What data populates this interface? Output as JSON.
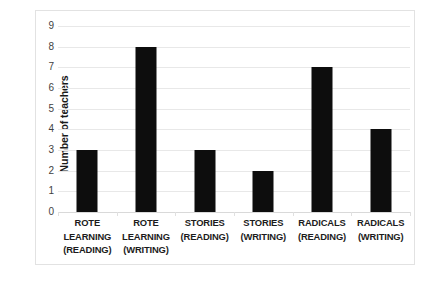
{
  "chart_data": {
    "type": "bar",
    "title": "",
    "xlabel": "",
    "ylabel": "Number of teachers",
    "categories": [
      "ROTE LEARNING (READING)",
      "ROTE LEARNING (WRITING)",
      "STORIES (READING)",
      "STORIES (WRITING)",
      "RADICALS (READING)",
      "RADICALS (WRITING)"
    ],
    "category_lines": [
      [
        "ROTE",
        "LEARNING",
        "(READING)"
      ],
      [
        "ROTE",
        "LEARNING",
        "(WRITING)"
      ],
      [
        "STORIES",
        "(READING)"
      ],
      [
        "STORIES",
        "(WRITING)"
      ],
      [
        "RADICALS",
        "(READING)"
      ],
      [
        "RADICALS",
        "(WRITING)"
      ]
    ],
    "values": [
      3,
      8,
      3,
      2,
      7,
      4
    ],
    "ylim": [
      0,
      9
    ],
    "ytick_labels": [
      "0",
      "1",
      "2",
      "3",
      "4",
      "5",
      "6",
      "7",
      "8",
      "9"
    ],
    "grid": true,
    "legend": false,
    "bar_color": "#0d0d0d",
    "gridline_color": "#e8e8e8",
    "plot_background": "#ffffff",
    "frame_color": "#e2e2e2"
  }
}
